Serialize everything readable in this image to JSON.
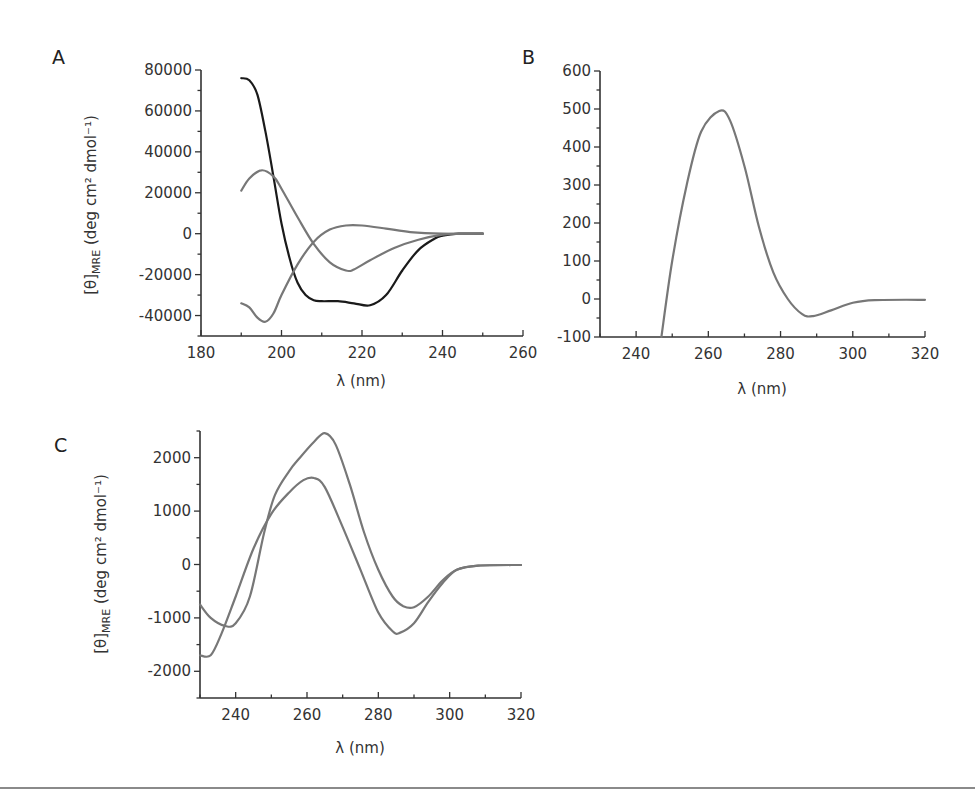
{
  "figure": {
    "panels": [
      {
        "label": "A",
        "xlabel": "λ (nm)",
        "ylabel_main": "[θ]",
        "ylabel_sub": "MRE",
        "ylabel_unit": " (deg cm² dmol⁻¹)"
      },
      {
        "label": "B",
        "xlabel": "λ (nm)"
      },
      {
        "label": "C",
        "xlabel": "λ (nm)",
        "ylabel_main": "[θ]",
        "ylabel_sub": "MRE",
        "ylabel_unit": " (deg cm² dmol⁻¹)"
      }
    ],
    "colors": {
      "black_series": "#1a1a1a",
      "gray_series": "#777777",
      "axis": "#333333"
    }
  },
  "chart_data": [
    {
      "panel": "A",
      "type": "line",
      "title": "",
      "xlabel": "λ (nm)",
      "ylabel": "[θ]MRE (deg cm² dmol⁻¹)",
      "xlim": [
        180,
        260
      ],
      "ylim": [
        -50000,
        80000
      ],
      "xticks": [
        180,
        200,
        220,
        240,
        260
      ],
      "yticks": [
        -40000,
        -20000,
        0,
        20000,
        40000,
        60000,
        80000
      ],
      "grid": false,
      "legend": null,
      "series": [
        {
          "name": "black",
          "color": "#1a1a1a",
          "x": [
            190,
            192,
            194,
            196,
            198,
            200,
            202,
            204,
            206,
            208,
            210,
            214,
            218,
            222,
            226,
            230,
            234,
            238,
            240,
            244,
            250
          ],
          "y": [
            76000,
            75000,
            68000,
            50000,
            28000,
            5000,
            -12000,
            -24000,
            -30000,
            -32500,
            -33000,
            -33000,
            -34000,
            -35000,
            -30000,
            -18000,
            -8000,
            -2500,
            -1000,
            0,
            0
          ]
        },
        {
          "name": "gray-1",
          "color": "#777777",
          "x": [
            190,
            192,
            195,
            198,
            200,
            204,
            208,
            212,
            216,
            218,
            222,
            228,
            234,
            240,
            244,
            250
          ],
          "y": [
            21000,
            27000,
            31000,
            28000,
            22000,
            8000,
            -5000,
            -14000,
            -18000,
            -17500,
            -13000,
            -7000,
            -3000,
            -500,
            0,
            0
          ]
        },
        {
          "name": "gray-2",
          "color": "#777777",
          "x": [
            190,
            192,
            194,
            196,
            198,
            200,
            204,
            208,
            212,
            216,
            220,
            226,
            232,
            240,
            250
          ],
          "y": [
            -34000,
            -36000,
            -41000,
            -43000,
            -39000,
            -30000,
            -15000,
            -4000,
            2000,
            4000,
            4000,
            2500,
            800,
            0,
            0
          ]
        }
      ]
    },
    {
      "panel": "B",
      "type": "line",
      "title": "",
      "xlabel": "λ (nm)",
      "ylabel": "",
      "xlim": [
        230,
        320
      ],
      "ylim": [
        -100,
        600
      ],
      "xticks": [
        240,
        260,
        280,
        300,
        320
      ],
      "yticks": [
        -100,
        0,
        100,
        200,
        300,
        400,
        500,
        600
      ],
      "grid": false,
      "legend": null,
      "series": [
        {
          "name": "gray",
          "color": "#777777",
          "x": [
            247,
            250,
            254,
            258,
            263,
            266,
            270,
            274,
            278,
            282,
            286,
            289,
            294,
            300,
            306,
            320
          ],
          "y": [
            -100,
            100,
            300,
            440,
            495,
            470,
            350,
            190,
            70,
            0,
            -40,
            -45,
            -30,
            -10,
            -3,
            -2
          ]
        }
      ]
    },
    {
      "panel": "C",
      "type": "line",
      "title": "",
      "xlabel": "λ (nm)",
      "ylabel": "[θ]MRE (deg cm² dmol⁻¹)",
      "xlim": [
        230,
        320
      ],
      "ylim": [
        -2500,
        2500
      ],
      "xticks": [
        240,
        260,
        280,
        300,
        320
      ],
      "yticks": [
        -2000,
        -1000,
        0,
        1000,
        2000
      ],
      "grid": false,
      "legend": null,
      "series": [
        {
          "name": "gray-upper",
          "color": "#777777",
          "x": [
            230,
            233,
            237,
            240,
            244,
            248,
            251,
            255,
            258,
            262,
            265,
            268,
            272,
            276,
            280,
            284,
            287,
            290,
            294,
            298,
            302,
            308,
            320
          ],
          "y": [
            -750,
            -1000,
            -1150,
            -1100,
            -600,
            600,
            1300,
            1750,
            2000,
            2300,
            2460,
            2250,
            1500,
            600,
            -100,
            -600,
            -780,
            -800,
            -600,
            -300,
            -100,
            -20,
            -10
          ]
        },
        {
          "name": "gray-lower",
          "color": "#777777",
          "x": [
            230,
            233,
            236,
            240,
            245,
            250,
            255,
            259,
            262,
            265,
            270,
            275,
            280,
            284,
            286,
            290,
            294,
            298,
            302,
            308,
            320
          ],
          "y": [
            -1700,
            -1700,
            -1300,
            -600,
            300,
            950,
            1350,
            1580,
            1620,
            1450,
            700,
            -100,
            -900,
            -1250,
            -1280,
            -1100,
            -700,
            -350,
            -100,
            -20,
            -10
          ]
        }
      ]
    }
  ]
}
